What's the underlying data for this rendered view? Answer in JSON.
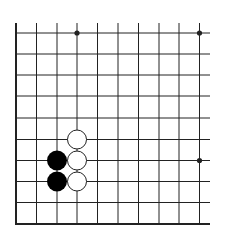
{
  "board": {
    "description": "Go board diagram, lower-left corner section",
    "grid": {
      "columns_x": [
        16,
        36.5,
        57,
        77,
        97.5,
        118,
        138.5,
        159,
        179,
        199.5
      ],
      "rows_y": [
        33,
        54,
        75,
        96,
        118,
        139.5,
        160.5,
        181.5,
        202.5,
        224
      ],
      "line_extend_top": 23,
      "line_extend_right": 210,
      "left_border_x": 16,
      "bottom_border_y": 224
    },
    "colors": {
      "background": "#ffffff",
      "line": "#222222",
      "black_stone": "#000000",
      "white_stone_fill": "#ffffff",
      "white_stone_stroke": "#222222"
    },
    "star_points": [
      {
        "col": 3,
        "row": 0
      },
      {
        "col": 9,
        "row": 0
      },
      {
        "col": 9,
        "row": 6
      }
    ],
    "stones": [
      {
        "color": "white",
        "col": 3,
        "row": 5
      },
      {
        "color": "white",
        "col": 3,
        "row": 6
      },
      {
        "color": "white",
        "col": 3,
        "row": 7
      },
      {
        "color": "black",
        "col": 2,
        "row": 6
      },
      {
        "color": "black",
        "col": 2,
        "row": 7
      }
    ],
    "stone_radius": 10
  }
}
